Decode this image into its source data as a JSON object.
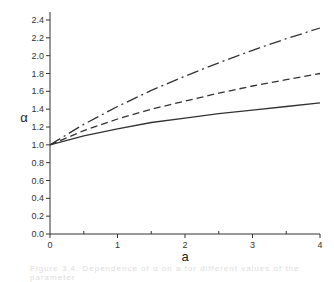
{
  "chart_data": {
    "type": "line",
    "title": "",
    "xlabel": "a",
    "ylabel": "α",
    "xlim": [
      0,
      4
    ],
    "ylim": [
      0,
      2.4
    ],
    "grid": false,
    "legend": null,
    "x_ticks": [
      "0",
      "1",
      "2",
      "3",
      "4"
    ],
    "y_ticks": [
      "0.0",
      "0.2",
      "0.4",
      "0.6",
      "0.8",
      "1.0",
      "1.2",
      "1.4",
      "1.6",
      "1.8",
      "2.0",
      "2.2",
      "2.4"
    ],
    "x": [
      0,
      0.5,
      1,
      1.5,
      2,
      2.5,
      3,
      3.5,
      4
    ],
    "series": [
      {
        "name": "solid",
        "style": "solid",
        "values": [
          1.0,
          1.1,
          1.18,
          1.25,
          1.3,
          1.35,
          1.39,
          1.43,
          1.47
        ]
      },
      {
        "name": "dashed",
        "style": "dashed",
        "values": [
          1.0,
          1.16,
          1.29,
          1.4,
          1.49,
          1.58,
          1.66,
          1.73,
          1.8
        ]
      },
      {
        "name": "dash-dot",
        "style": "dashdot",
        "values": [
          1.0,
          1.23,
          1.43,
          1.61,
          1.77,
          1.92,
          2.06,
          2.19,
          2.31
        ]
      }
    ]
  },
  "caption": "Figure 3.4: Dependence of α on a for different values of the parameter"
}
